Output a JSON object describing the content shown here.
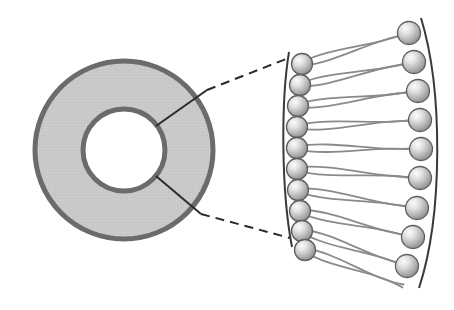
{
  "figure": {
    "canvas": {
      "width": 454,
      "height": 310,
      "background": "#ffffff"
    }
  },
  "colors": {
    "background": "#ffffff",
    "membrane_fill": "#c9c9c9",
    "membrane_stroke": "#6b6b6b",
    "lumen_fill": "#ffffff",
    "head_light": "#f2f2f2",
    "head_mid": "#c0c0c0",
    "head_dark": "#8e8e8e",
    "head_stroke": "#5e5e5e",
    "tail_stroke": "#8a8a8a",
    "leader_line": "#2b2b2b",
    "dashed_line": "#2b2b2b",
    "boundary_arc": "#3a3a3a"
  },
  "vesicle": {
    "label": "liposome-cross-section",
    "center_x": 124,
    "center_y": 150,
    "outer_radius": 89,
    "inner_radius": 41,
    "shell_stroke_width": 5,
    "fill": "#c9c9c9",
    "stroke": "#6b6b6b"
  },
  "leaders": {
    "upper_pointer": {
      "x1": 156,
      "y1": 126,
      "x2": 207,
      "y2": 90
    },
    "lower_pointer": {
      "x1": 156,
      "y1": 176,
      "x2": 201,
      "y2": 214
    },
    "upper_dashed": {
      "x1": 207,
      "y1": 90,
      "x2": 286,
      "y2": 59
    },
    "lower_dashed": {
      "x1": 201,
      "y1": 214,
      "x2": 290,
      "y2": 238
    },
    "dash_pattern": "9 6",
    "stroke_width": 2
  },
  "bilayer": {
    "label": "magnified-phospholipid-bilayer",
    "inner_leaflet_label": "inner-leaflet",
    "outer_leaflet_label": "outer-leaflet",
    "inner_head_count": 10,
    "outer_head_count": 9,
    "head_radius_inner": 10.5,
    "head_radius_outer": 11.5,
    "inner_arc_path": "M 289 52 C 281 100 281 190 292 247",
    "outer_arc_path": "M 421 18 C 443 90 443 215 419 288",
    "inner_heads": [
      {
        "cx": 302,
        "cy": 64
      },
      {
        "cx": 300,
        "cy": 85
      },
      {
        "cx": 298,
        "cy": 106
      },
      {
        "cx": 297,
        "cy": 127
      },
      {
        "cx": 297,
        "cy": 148
      },
      {
        "cx": 297,
        "cy": 169
      },
      {
        "cx": 298,
        "cy": 190
      },
      {
        "cx": 300,
        "cy": 211
      },
      {
        "cx": 302,
        "cy": 231
      },
      {
        "cx": 305,
        "cy": 250
      }
    ],
    "outer_heads": [
      {
        "cx": 409,
        "cy": 33
      },
      {
        "cx": 414,
        "cy": 62
      },
      {
        "cx": 418,
        "cy": 91
      },
      {
        "cx": 420,
        "cy": 120
      },
      {
        "cx": 421,
        "cy": 149
      },
      {
        "cx": 420,
        "cy": 178
      },
      {
        "cx": 417,
        "cy": 208
      },
      {
        "cx": 413,
        "cy": 237
      },
      {
        "cx": 407,
        "cy": 266
      }
    ],
    "tail_pairs": [
      {
        "from": [
          302,
          64
        ],
        "to": [
          409,
          33
        ],
        "offset": 5
      },
      {
        "from": [
          300,
          85
        ],
        "to": [
          414,
          62
        ],
        "offset": 5
      },
      {
        "from": [
          298,
          106
        ],
        "to": [
          418,
          91
        ],
        "offset": 5
      },
      {
        "from": [
          297,
          127
        ],
        "to": [
          420,
          120
        ],
        "offset": 5
      },
      {
        "from": [
          297,
          148
        ],
        "to": [
          421,
          149
        ],
        "offset": 5
      },
      {
        "from": [
          297,
          169
        ],
        "to": [
          420,
          178
        ],
        "offset": 5
      },
      {
        "from": [
          298,
          190
        ],
        "to": [
          417,
          208
        ],
        "offset": 5
      },
      {
        "from": [
          300,
          211
        ],
        "to": [
          413,
          237
        ],
        "offset": 5
      },
      {
        "from": [
          302,
          231
        ],
        "to": [
          407,
          266
        ],
        "offset": 5
      },
      {
        "from": [
          305,
          250
        ],
        "to": [
          403,
          286
        ],
        "offset": 5
      }
    ]
  }
}
